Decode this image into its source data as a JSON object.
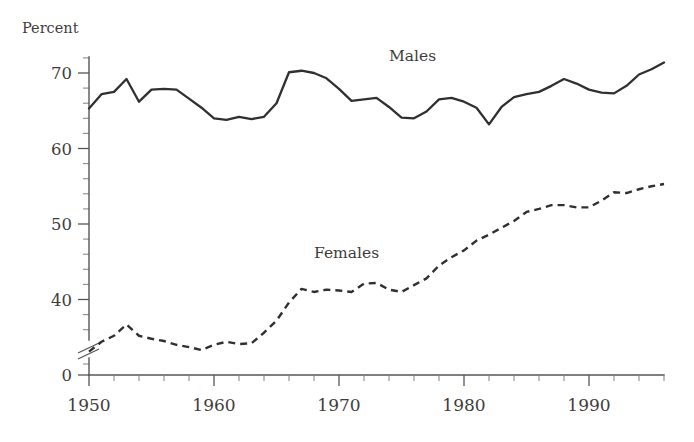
{
  "chart_data": {
    "type": "line",
    "title": "",
    "subtitle": "",
    "xlabel": "",
    "ylabel": "Percent",
    "ylabel_position": "top-left",
    "grid": false,
    "legend": "inline-annotations",
    "xlim": [
      1950,
      1996
    ],
    "ylim": [
      0,
      74
    ],
    "y_axis_break": true,
    "y_axis_break_between": [
      0,
      32
    ],
    "y_major_ticks": [
      0,
      40,
      50,
      60,
      70
    ],
    "y_minor_tick_step": 2,
    "x_major_ticks": [
      1950,
      1960,
      1970,
      1980,
      1990
    ],
    "x_minor_tick_step": 2,
    "x_tick_labels": [
      "1950",
      "1960",
      "1970",
      "1980",
      "1990"
    ],
    "y_tick_labels": [
      "0",
      "40",
      "50",
      "60",
      "70"
    ],
    "x": [
      1950,
      1951,
      1952,
      1953,
      1954,
      1955,
      1956,
      1957,
      1958,
      1959,
      1960,
      1961,
      1962,
      1963,
      1964,
      1965,
      1966,
      1967,
      1968,
      1969,
      1970,
      1971,
      1972,
      1973,
      1974,
      1975,
      1976,
      1977,
      1978,
      1979,
      1980,
      1981,
      1982,
      1983,
      1984,
      1985,
      1986,
      1987,
      1988,
      1989,
      1990,
      1991,
      1992,
      1993,
      1994,
      1995,
      1996
    ],
    "series": [
      {
        "name": "Males",
        "style": "solid",
        "label_x": 1974,
        "label_y": 71.6,
        "values": [
          65.3,
          67.2,
          67.5,
          69.2,
          66.2,
          67.8,
          67.9,
          67.8,
          66.6,
          65.4,
          64.0,
          63.8,
          64.2,
          63.9,
          64.2,
          66.0,
          70.1,
          70.3,
          70.0,
          69.3,
          67.9,
          66.3,
          66.5,
          66.7,
          65.5,
          64.1,
          64.0,
          64.9,
          66.5,
          66.7,
          66.2,
          65.4,
          63.2,
          65.5,
          66.8,
          67.2,
          67.5,
          68.3,
          69.2,
          68.6,
          67.8,
          67.4,
          67.3,
          68.3,
          69.8,
          70.5,
          71.4
        ]
      },
      {
        "name": "Females",
        "style": "dashed",
        "label_x": 1968,
        "label_y": 45.5,
        "values": [
          33.1,
          34.4,
          35.2,
          36.7,
          35.2,
          34.8,
          34.5,
          34.0,
          33.7,
          33.3,
          34.0,
          34.4,
          34.1,
          34.2,
          35.6,
          37.2,
          39.6,
          41.4,
          41.0,
          41.3,
          41.2,
          41.0,
          42.1,
          42.2,
          41.3,
          41.0,
          41.9,
          42.8,
          44.5,
          45.6,
          46.5,
          47.8,
          48.6,
          49.5,
          50.4,
          51.6,
          52.0,
          52.5,
          52.5,
          52.2,
          52.2,
          53.1,
          54.2,
          54.1,
          54.6,
          55.0,
          55.3
        ]
      }
    ]
  },
  "chart": {
    "y_axis_title": "Percent",
    "series_label_males": "Males",
    "series_label_females": "Females",
    "axis_color": "#565656",
    "line_color": "#32302f",
    "text_color": "#3f3d3c",
    "background": "#ffffff"
  }
}
